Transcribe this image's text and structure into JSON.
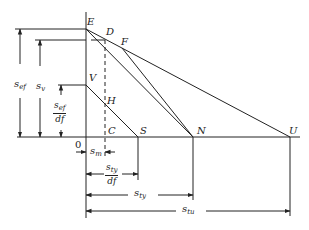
{
  "points": {
    "E": "E",
    "D": "D",
    "F": "F",
    "V": "V",
    "H": "H",
    "C": "C",
    "S": "S",
    "N": "N",
    "U": "U",
    "O": "0"
  },
  "dimensions": {
    "s_ef": {
      "base": "s",
      "sub": "ef"
    },
    "s_v": {
      "base": "s",
      "sub": "v"
    },
    "s_ef_df": {
      "num_base": "s",
      "num_sub": "ef",
      "den": "df"
    },
    "s_m": {
      "base": "s",
      "sub": "m"
    },
    "s_ty_df": {
      "num_base": "s",
      "num_sub": "ty",
      "den": "df"
    },
    "s_ty": {
      "base": "s",
      "sub": "ty"
    },
    "s_tu": {
      "base": "s",
      "sub": "tu"
    }
  },
  "colors": {
    "line": "#222222",
    "background": "#ffffff"
  }
}
